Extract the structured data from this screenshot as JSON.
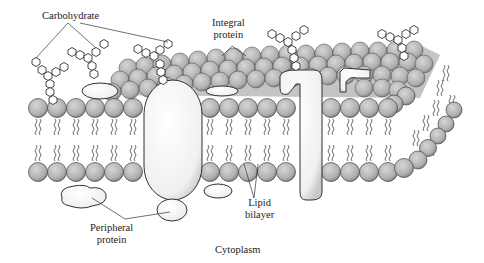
{
  "diagram": {
    "type": "cell-membrane-cross-section",
    "labels": {
      "carbohydrate": "Carbohydrate",
      "integral_protein_line1": "Integral",
      "integral_protein_line2": "protein",
      "lipid_bilayer_line1": "Lipid",
      "lipid_bilayer_line2": "bilayer",
      "peripheral_protein_line1": "Peripheral",
      "peripheral_protein_line2": "protein",
      "cytoplasm": "Cytoplasm"
    },
    "components": [
      "phospholipid heads",
      "fatty acid tails",
      "integral proteins",
      "peripheral proteins",
      "carbohydrate chains"
    ],
    "colors": {
      "lipid_head": "#b8b8b8",
      "lipid_head_dark": "#8a8a8a",
      "outline": "#333333",
      "protein_fill": "#f4f4f4"
    }
  }
}
